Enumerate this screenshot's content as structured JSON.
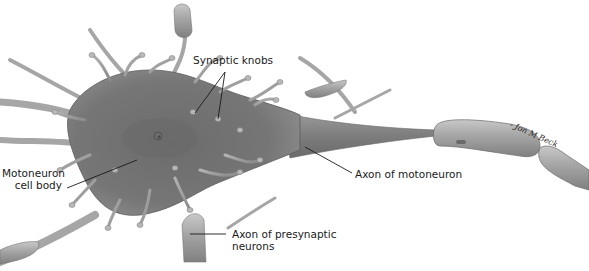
{
  "figure": {
    "labels": {
      "synaptic_knobs": "Synaptic knobs",
      "cell_body_line1": "Motoneuron",
      "cell_body_line2": "cell body",
      "axon_motoneuron": "Axon of motoneuron",
      "axon_presynaptic_line1": "Axon of presynaptic",
      "axon_presynaptic_line2": "neurons"
    },
    "signature": "- Jon M Beck",
    "colors": {
      "background": "#ffffff",
      "cell_body": "#7a7a7a",
      "cell_body_dark": "#5e5e5e",
      "dendrite": "#9a9a9a",
      "myelin": "#a8a8a8",
      "leader_line": "#1a1a1a",
      "text": "#1a1a1a"
    }
  }
}
